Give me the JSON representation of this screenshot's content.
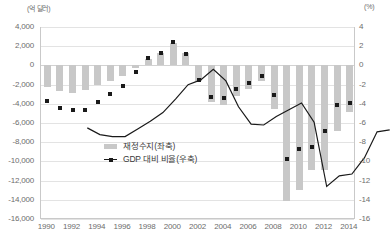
{
  "chart_data": {
    "type": "bar",
    "title": "",
    "xlabel": "",
    "ylabel": "(억 달러)",
    "y2label": "(%)",
    "ylim": [
      -16000,
      4000
    ],
    "y2lim": [
      -16,
      4
    ],
    "ytick_step": 2000,
    "y2tick_step": 2,
    "grid": true,
    "legend_position": "inside-center-left",
    "x": [
      1990,
      1991,
      1992,
      1993,
      1994,
      1995,
      1996,
      1997,
      1998,
      1999,
      2000,
      2001,
      2002,
      2003,
      2004,
      2005,
      2006,
      2007,
      2008,
      2009,
      2010,
      2011,
      2012,
      2013,
      2014
    ],
    "xtick_labels": [
      "1990",
      "1992",
      "1994",
      "1996",
      "1998",
      "2000",
      "2002",
      "2004",
      "2006",
      "2008",
      "2010",
      "2012",
      "2014"
    ],
    "ytick_labels": [
      "4,000",
      "2,000",
      "0",
      "-2,000",
      "-4,000",
      "-6,000",
      "-8,000",
      "-10,000",
      "-12,000",
      "-14,000",
      "-16,000"
    ],
    "y2tick_labels": [
      "4",
      "2",
      "0",
      "-2",
      "-4",
      "-6",
      "-8",
      "-10",
      "-12",
      "-14",
      "-16"
    ],
    "series": [
      {
        "name": "재정수지(좌축)",
        "type": "bar",
        "axis": "left",
        "unit": "억 달러",
        "color": "#c8c8c8",
        "values": [
          -2210,
          -2690,
          -2900,
          -2550,
          -2030,
          -1640,
          -1070,
          -220,
          690,
          1260,
          2360,
          1280,
          -1580,
          -3780,
          -4130,
          -3180,
          -2480,
          -1610,
          -4590,
          -14130,
          -12940,
          -10870,
          -10870,
          -6800,
          -4850
        ]
      },
      {
        "name": "GDP 대비 비율(우축)",
        "type": "line",
        "axis": "right",
        "unit": "%",
        "color": "#1a1a1a",
        "marker": "square",
        "values": [
          -3.7,
          -4.4,
          -4.6,
          -4.6,
          -3.8,
          -3.0,
          -2.1,
          -0.7,
          0.8,
          1.3,
          2.4,
          1.2,
          -1.5,
          -3.3,
          -3.4,
          -2.5,
          -1.8,
          -1.1,
          -3.1,
          -9.8,
          -8.7,
          -8.5,
          -6.8,
          -4.1,
          -3.9
        ]
      }
    ]
  },
  "legend": {
    "items": [
      {
        "label": "재정수지(좌축)",
        "swatch": "bar-swatch"
      },
      {
        "label": "GDP 대비 비율(우축)",
        "swatch": "line-marker-swatch"
      }
    ]
  }
}
